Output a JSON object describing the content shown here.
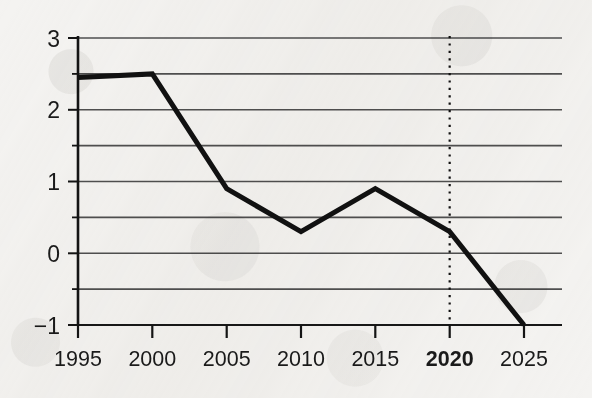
{
  "chart_data": {
    "type": "line",
    "title": "",
    "subtitle": "",
    "xlabel": "",
    "ylabel": "",
    "x": [
      1995,
      2000,
      2005,
      2010,
      2015,
      2020,
      2025
    ],
    "categories": [
      "1995",
      "2000",
      "2005",
      "2010",
      "2015",
      "2020",
      "2025"
    ],
    "values": [
      2.45,
      2.5,
      0.9,
      0.3,
      0.9,
      0.3,
      -1.0
    ],
    "series": [
      {
        "name": "",
        "values": [
          2.45,
          2.5,
          0.9,
          0.3,
          0.9,
          0.3,
          -1.0
        ],
        "color": "#111111",
        "line_width": 5
      }
    ],
    "xlim": [
      1995,
      2025
    ],
    "ylim": [
      -1,
      3
    ],
    "y_major_ticks": [
      3,
      2,
      1,
      0,
      -1
    ],
    "y_major_tick_labels": [
      "3",
      "2",
      "1",
      "0",
      "−1"
    ],
    "y_minor_ticks": [
      2.5,
      1.5,
      0.5,
      -0.5
    ],
    "gridlines": [
      3,
      2.5,
      2,
      1.5,
      1,
      0.5,
      0,
      -0.5,
      -1
    ],
    "grid": true,
    "grid_color": "#4f4f4f",
    "legend": "none",
    "annotations": [
      {
        "type": "vertical-dotted-line",
        "x": 2020,
        "label": "2020",
        "emphasis": true,
        "color": "#111111"
      }
    ],
    "x_tick_labels": [
      {
        "text": "1995",
        "x": 1995,
        "bold": false
      },
      {
        "text": "2000",
        "x": 2000,
        "bold": false
      },
      {
        "text": "2005",
        "x": 2005,
        "bold": false
      },
      {
        "text": "2010",
        "x": 2010,
        "bold": false
      },
      {
        "text": "2015",
        "x": 2015,
        "bold": false
      },
      {
        "text": "2020",
        "x": 2020,
        "bold": true
      },
      {
        "text": "2025",
        "x": 2025,
        "bold": false
      }
    ]
  },
  "colors": {
    "background": "#f4f3f1",
    "axis": "#141414",
    "grid": "#4f4f4f",
    "data_line": "#111111",
    "text": "#1a1a1a"
  }
}
